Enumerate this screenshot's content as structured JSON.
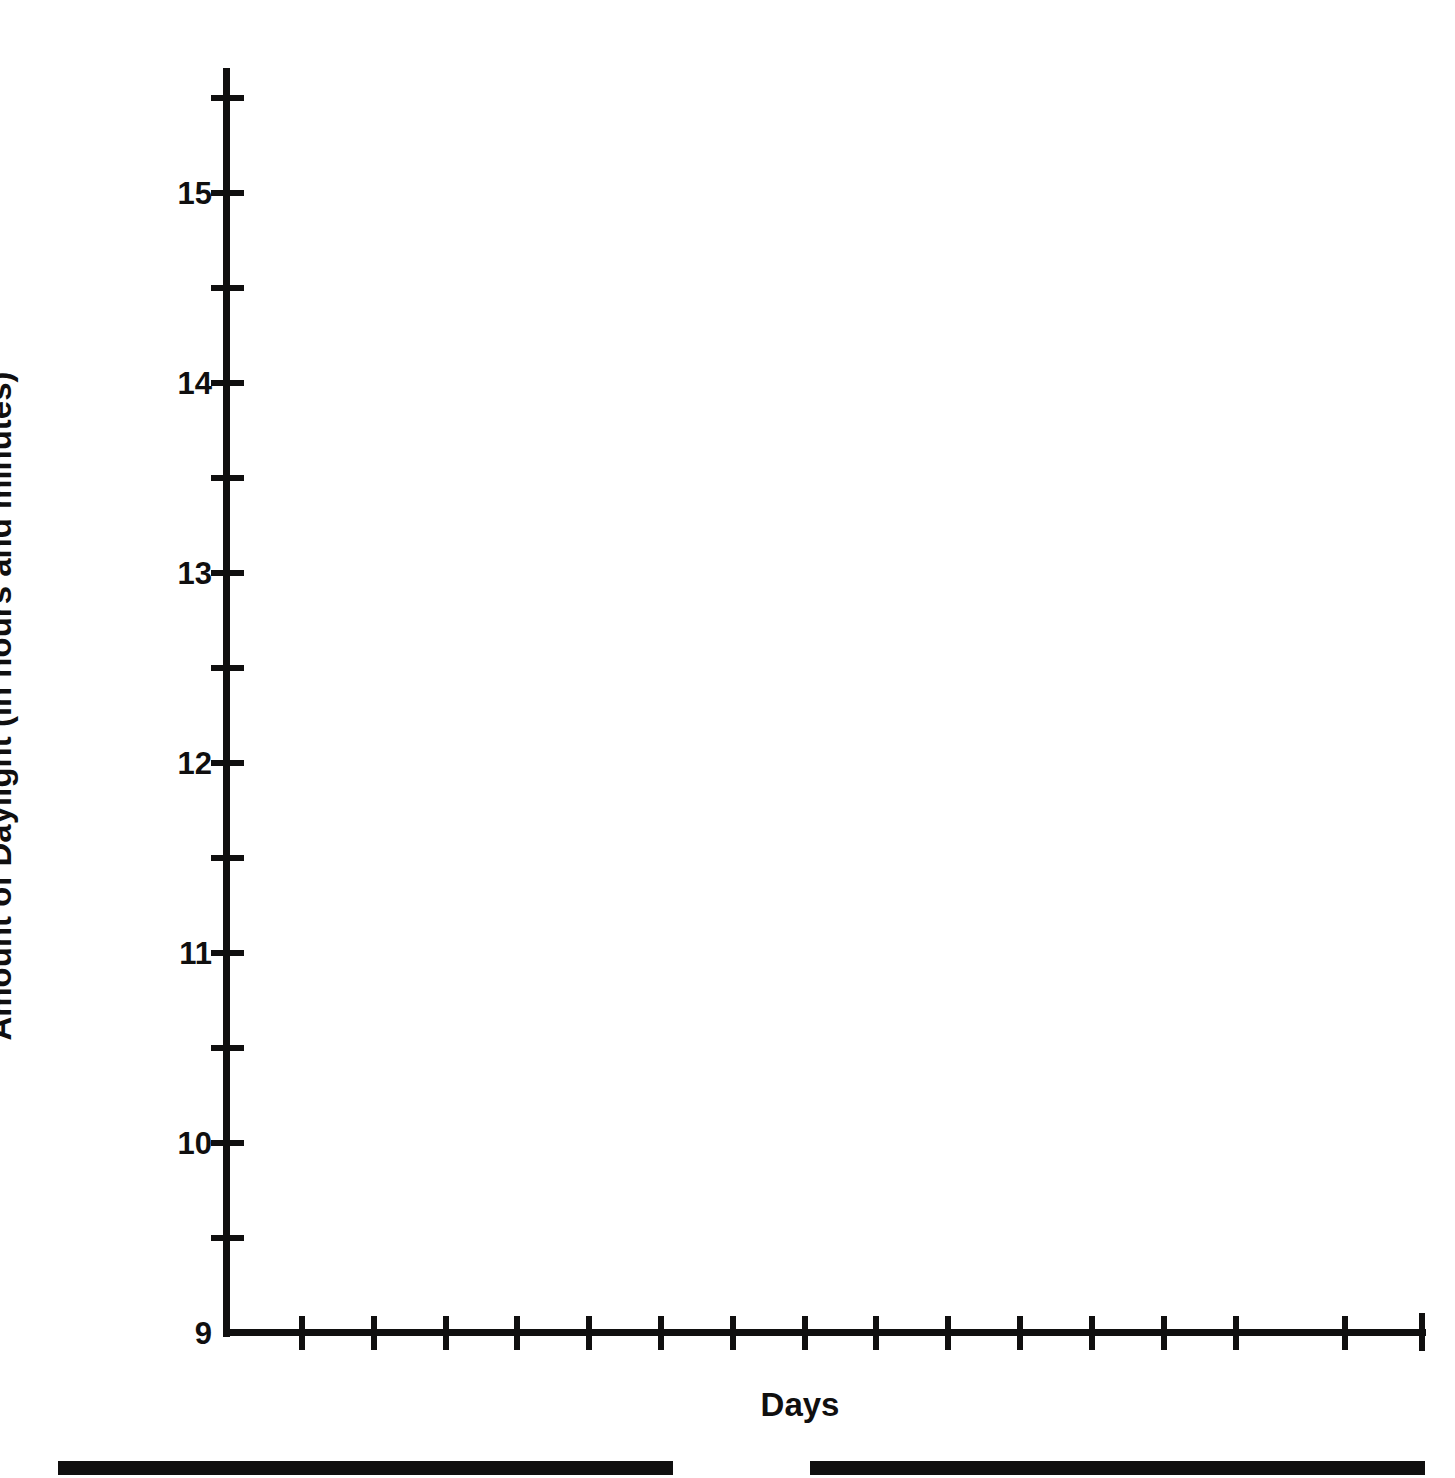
{
  "figure": {
    "background_color": "#ffffff",
    "ink_color": "#100f0f"
  },
  "chart_data": {
    "type": "line",
    "title": "",
    "subtitle": "",
    "xlabel": "Days",
    "ylabel": "Amount of Daylight (in hours and minutes)",
    "ylim": [
      9,
      15.6
    ],
    "xlim": [
      0,
      16
    ],
    "grid": false,
    "legend": null,
    "series": [],
    "x": [],
    "y_major_ticks": [
      9,
      10,
      11,
      12,
      13,
      14,
      15
    ],
    "y_major_tick_labels": [
      "9",
      "10",
      "11",
      "12",
      "13",
      "14",
      "15"
    ],
    "y_minor_ticks": [
      9.5,
      10.5,
      11.5,
      12.5,
      13.5,
      14.5,
      15.5
    ],
    "x_tick_labels": [],
    "x_tick_count": 15,
    "note": "Blank plotting grid: axes drawn with tick marks but no data plotted."
  },
  "y_axis": {
    "title": "Amount of Daylight (in hours and minutes)",
    "ticks": [
      {
        "label": "15",
        "value": 15,
        "major": true
      },
      {
        "label": "",
        "value": 15.5,
        "major": false
      },
      {
        "label": "",
        "value": 14.5,
        "major": false
      },
      {
        "label": "14",
        "value": 14,
        "major": true
      },
      {
        "label": "",
        "value": 13.5,
        "major": false
      },
      {
        "label": "13",
        "value": 13,
        "major": true
      },
      {
        "label": "",
        "value": 12.5,
        "major": false
      },
      {
        "label": "12",
        "value": 12,
        "major": true
      },
      {
        "label": "",
        "value": 11.5,
        "major": false
      },
      {
        "label": "11",
        "value": 11,
        "major": true
      },
      {
        "label": "",
        "value": 10.5,
        "major": false
      },
      {
        "label": "10",
        "value": 10,
        "major": true
      },
      {
        "label": "",
        "value": 9.5,
        "major": false
      },
      {
        "label": "9",
        "value": 9,
        "major": true
      }
    ]
  },
  "x_axis": {
    "title": "Days",
    "tick_positions_px": [
      302,
      374,
      446,
      517,
      589,
      661,
      733,
      805,
      876,
      948,
      1020,
      1092,
      1164,
      1236,
      1345
    ]
  },
  "page_rules": [
    {
      "name": "left-rule",
      "left_px": 58,
      "width_px": 615,
      "top_px": 1461
    },
    {
      "name": "right-rule",
      "left_px": 810,
      "width_px": 615,
      "top_px": 1461
    }
  ]
}
